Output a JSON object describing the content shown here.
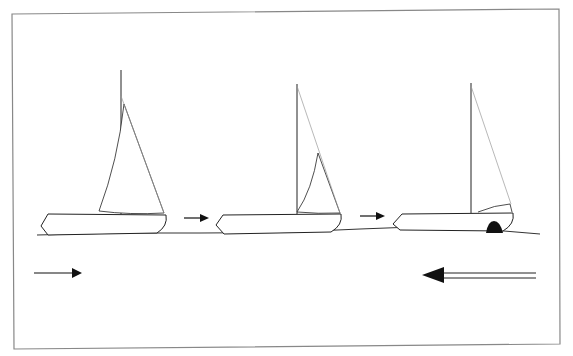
{
  "figure": {
    "frame_color": "#888888",
    "line_color": "#222222",
    "rigging_color": "#999999",
    "stages": [
      {
        "label": "boat-1",
        "sails": "mainsail and jib raised"
      },
      {
        "label": "boat-2",
        "sails": "mainsail lowered, jib partly raised"
      },
      {
        "label": "boat-3",
        "sails": "sails lowered, bow fender"
      }
    ],
    "arrows": [
      {
        "name": "progress-arrow-1",
        "direction": "right"
      },
      {
        "name": "progress-arrow-2",
        "direction": "right"
      },
      {
        "name": "boat-direction-arrow",
        "direction": "right"
      },
      {
        "name": "wind-direction-arrow",
        "direction": "left"
      }
    ],
    "caption": ""
  }
}
